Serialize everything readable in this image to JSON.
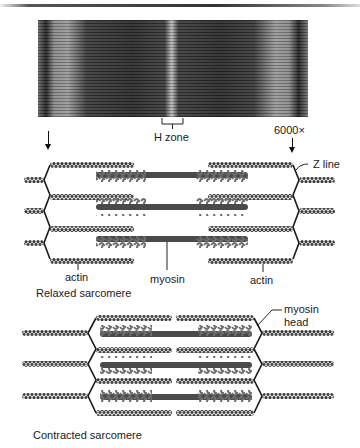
{
  "figure": {
    "micrograph": {
      "magnification": "6000×",
      "h_zone_label": "H zone"
    },
    "relaxed": {
      "caption": "Relaxed sarcomere",
      "labels": {
        "actin_left": "actin",
        "myosin": "myosin",
        "actin_right": "actin",
        "z_line": "Z line"
      }
    },
    "contracted": {
      "caption": "Contracted sarcomere",
      "labels": {
        "myosin_head_line1": "myosin",
        "myosin_head_line2": "head"
      }
    },
    "colors": {
      "filament": "#3a3a3a",
      "myosin_head": "#6e6e6e",
      "z_line": "#1a1a1a",
      "background": "#ffffff"
    }
  }
}
